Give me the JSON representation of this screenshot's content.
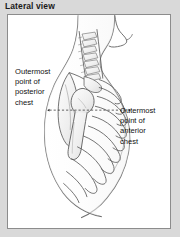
{
  "figure": {
    "title": "Lateral view",
    "type": "anatomical-illustration",
    "background_color": "#d9d9d9",
    "panel_color": "#ffffff",
    "panel_border_color": "#8c8c8c",
    "line_color": "#4a4a4a",
    "text_color": "#111111"
  },
  "labels": {
    "posterior": {
      "name": "outermost-point-posterior-chest",
      "line1": "Outermost",
      "line2": "point of",
      "line3": "posterior",
      "line4": "chest"
    },
    "anterior": {
      "name": "outermost-point-anterior-chest",
      "line1": "Outermost",
      "line2": "point of",
      "line3": "anterior",
      "line4": "chest"
    }
  },
  "annotations": {
    "measurement_line": {
      "style": "dashed",
      "arrowheads": "both-ends",
      "orientation": "horizontal",
      "description": "dashed horizontal line spanning from posterior chest landmark to anterior chest landmark"
    }
  },
  "anatomy_parts": [
    "head-and-neck-profile",
    "cervical-spine",
    "thoracic-spine",
    "scapula",
    "humerus",
    "rib-cage",
    "torso-outline"
  ]
}
